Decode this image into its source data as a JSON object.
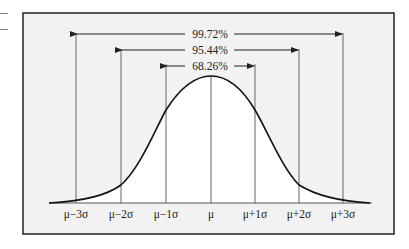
{
  "diagram": {
    "colors": {
      "frame_border": "#222222",
      "panel_fill": "#f2f2f2",
      "under_curve_fill": "#ffffff",
      "curve": "#111111",
      "guide_lines": "#666666",
      "text": "#222222"
    },
    "intervals": [
      {
        "label": "99.72%",
        "from": "μ−3σ",
        "to": "μ+3σ"
      },
      {
        "label": "95.44%",
        "from": "μ−2σ",
        "to": "μ+2σ"
      },
      {
        "label": "68.26%",
        "from": "μ−1σ",
        "to": "μ+1σ"
      }
    ],
    "axis_labels": [
      "μ−3σ",
      "μ−2σ",
      "μ−1σ",
      "μ",
      "μ+1σ",
      "μ+2σ",
      "μ+3σ"
    ]
  }
}
